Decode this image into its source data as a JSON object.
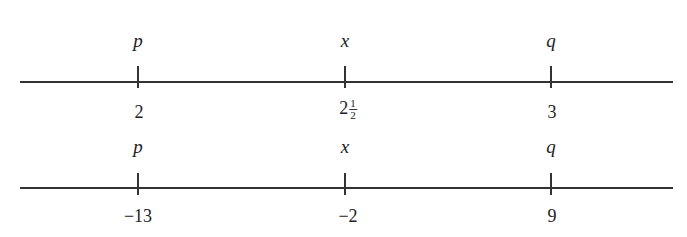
{
  "diagram": {
    "type": "number-lines",
    "number_lines": [
      {
        "points": [
          {
            "label": "p",
            "value": "2"
          },
          {
            "label": "x",
            "value_whole": "2",
            "value_num": "1",
            "value_den": "2",
            "value_display": "2 1/2"
          },
          {
            "label": "q",
            "value": "3"
          }
        ]
      },
      {
        "points": [
          {
            "label": "p",
            "value": "−13"
          },
          {
            "label": "x",
            "value": "−2"
          },
          {
            "label": "q",
            "value": "9"
          }
        ]
      }
    ]
  }
}
